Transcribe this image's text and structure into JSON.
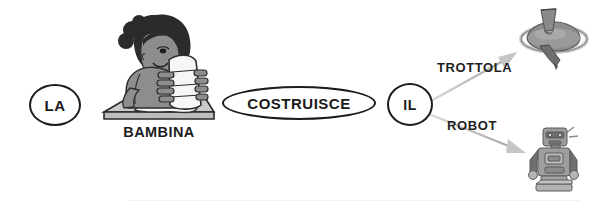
{
  "diagram": {
    "type": "sentence-structure-diagram",
    "language": "Italian",
    "sentence": "LA BAMBINA COSTRUISCE IL TROTTOLA / ROBOT",
    "nodes": [
      {
        "id": "la",
        "label": "LA",
        "shape": "ellipse"
      },
      {
        "id": "bambina",
        "label": "BAMBINA",
        "shape": "picture-caption"
      },
      {
        "id": "costruisce",
        "label": "COSTRUISCE",
        "shape": "ellipse"
      },
      {
        "id": "il",
        "label": "IL",
        "shape": "circle"
      }
    ],
    "edges": [
      {
        "id": "edge-trottola",
        "label": "TROTTOLA",
        "from": "il",
        "to": "trottola-image"
      },
      {
        "id": "edge-robot",
        "label": "ROBOT",
        "from": "il",
        "to": "robot-image"
      }
    ],
    "images": [
      {
        "id": "girl",
        "name": "girl-building-illustration",
        "caption": "BAMBINA"
      },
      {
        "id": "trottola",
        "name": "spinning-top-photo",
        "caption": "TROTTOLA"
      },
      {
        "id": "robot",
        "name": "toy-robot-photo",
        "caption": "ROBOT"
      }
    ],
    "colors": {
      "stroke": "#1c1c1c",
      "text": "#1a1a1a",
      "arrow": "#b4b4b4",
      "background": "#ffffff",
      "skin": "#8c8c8c",
      "hair": "#2b2b2b",
      "paper": "#f4f4f4",
      "table": "#b9b9b9",
      "toy": "#9a9a9a"
    }
  }
}
